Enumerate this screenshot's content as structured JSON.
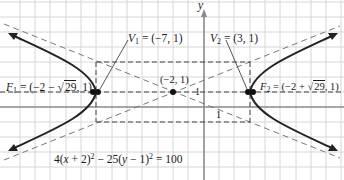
{
  "figure": {
    "axis_label_y": "y",
    "center_label": "(−2, 1)",
    "vertex1": {
      "name": "V",
      "sub": "1",
      "value": "= (−7, 1)"
    },
    "vertex2": {
      "name": "V",
      "sub": "2",
      "value": "= (3, 1)"
    },
    "focus1": {
      "name": "F",
      "sub": "1",
      "prefix": "= (−2 − ",
      "radicand": "29",
      "suffix": ", 1)"
    },
    "focus2": {
      "name": "F",
      "sub": "2",
      "prefix": "= (−2 + ",
      "radicand": "29",
      "suffix": ", 1)"
    },
    "tick_label_horizontal": "1",
    "tick_label_vertical": "1",
    "equation": {
      "part1": "4(",
      "var1": "x",
      "part2": " + 2)",
      "exp1": "2",
      "part3": " − 25(",
      "var2": "y",
      "part4": " − 1)",
      "exp2": "2",
      "part5": " = 100"
    },
    "colors": {
      "grid": "#d4d4d4",
      "axis": "#8a8a8a",
      "curve": "#222222",
      "dashed": "#666666"
    }
  }
}
